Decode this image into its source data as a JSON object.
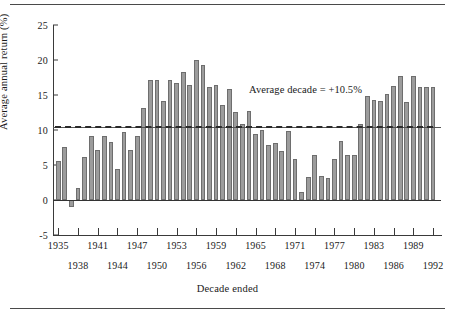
{
  "chart_data": {
    "type": "bar",
    "title": "",
    "xlabel": "Decade ended",
    "ylabel": "Average annual return (%)",
    "ylim": [
      -5,
      25
    ],
    "yticks": [
      -5,
      0,
      5,
      10,
      15,
      20,
      25
    ],
    "ytick_labels": [
      "-5",
      "0",
      "5",
      "10",
      "15",
      "20",
      "25"
    ],
    "grid": false,
    "legend": null,
    "annotations": [
      {
        "text": "Average decade = +10.5%",
        "x": 1966,
        "y": 16.0
      }
    ],
    "reference_lines": [
      {
        "label": "Average decade",
        "value": 10.5,
        "style": "solid-with-dashed-overlay"
      },
      {
        "label": "Zero",
        "value": 0,
        "style": "solid"
      }
    ],
    "average_decade": 10.5,
    "xtick_labels_row1": [
      "1935",
      "1941",
      "1947",
      "1953",
      "1959",
      "1965",
      "1971",
      "1977",
      "1983",
      "1989"
    ],
    "xtick_labels_row2": [
      "1938",
      "1944",
      "1950",
      "1956",
      "1962",
      "1968",
      "1974",
      "1980",
      "1986",
      "1992"
    ],
    "categories": [
      "1935",
      "1936",
      "1937",
      "1938",
      "1939",
      "1940",
      "1941",
      "1942",
      "1943",
      "1944",
      "1945",
      "1946",
      "1947",
      "1948",
      "1949",
      "1950",
      "1951",
      "1952",
      "1953",
      "1954",
      "1955",
      "1956",
      "1957",
      "1958",
      "1959",
      "1960",
      "1961",
      "1962",
      "1963",
      "1964",
      "1965",
      "1966",
      "1967",
      "1968",
      "1969",
      "1970",
      "1971",
      "1972",
      "1973",
      "1974",
      "1975",
      "1976",
      "1977",
      "1978",
      "1979",
      "1980",
      "1981",
      "1982",
      "1983",
      "1984",
      "1985",
      "1986",
      "1987",
      "1988",
      "1989",
      "1990",
      "1991",
      "1992"
    ],
    "values": [
      5.6,
      7.6,
      -1.0,
      1.7,
      6.2,
      9.2,
      7.1,
      9.2,
      8.3,
      4.5,
      9.7,
      7.2,
      9.2,
      13.1,
      17.2,
      17.1,
      14.2,
      17.1,
      16.7,
      18.3,
      16.5,
      20.0,
      19.3,
      16.1,
      16.4,
      13.6,
      15.8,
      12.6,
      10.9,
      12.7,
      9.4,
      10.0,
      7.9,
      8.2,
      7.0,
      9.9,
      5.8,
      1.2,
      3.3,
      6.5,
      3.5,
      3.2,
      5.9,
      8.5,
      6.4,
      6.5,
      10.8,
      14.8,
      14.3,
      14.2,
      15.1,
      16.3,
      17.7,
      14.0,
      17.7,
      16.1,
      16.1,
      16.1
    ],
    "series": [
      {
        "name": "Average annual return",
        "values": [
          5.6,
          7.6,
          -1.0,
          1.7,
          6.2,
          9.2,
          7.1,
          9.2,
          8.3,
          4.5,
          9.7,
          7.2,
          9.2,
          13.1,
          17.2,
          17.1,
          14.2,
          17.1,
          16.7,
          18.3,
          16.5,
          20.0,
          19.3,
          16.1,
          16.4,
          13.6,
          15.8,
          12.6,
          10.9,
          12.7,
          9.4,
          10.0,
          7.9,
          8.2,
          7.0,
          9.9,
          5.8,
          1.2,
          3.3,
          6.5,
          3.5,
          3.2,
          5.9,
          8.5,
          6.4,
          6.5,
          10.8,
          14.8,
          14.3,
          14.2,
          15.1,
          16.3,
          17.7,
          14.0,
          17.7,
          16.1,
          16.1,
          16.1
        ],
        "color": "#9c9c9c"
      }
    ]
  },
  "colors": {
    "bar_fill": "#9c9c9c",
    "bar_stroke": "#6e6e6e",
    "axis": "#3a3a3a",
    "text": "#1a1a1a",
    "background": "#ffffff"
  }
}
